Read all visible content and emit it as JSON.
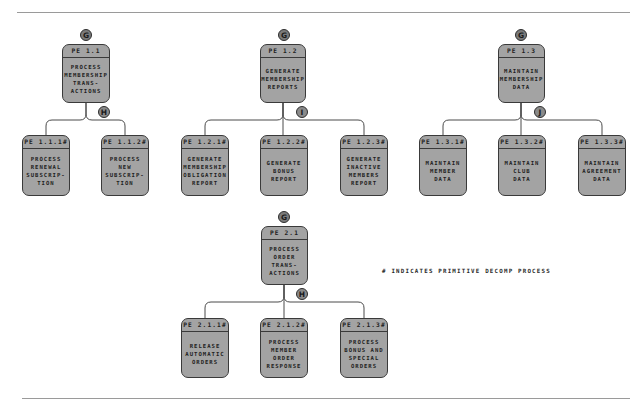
{
  "diagram": {
    "type": "process decomposition hierarchy",
    "colors": {
      "box_fill": "#a3a3a3",
      "box_border": "#3a3a3a",
      "badge_fill": "#8a8a8a",
      "line": "#555555"
    },
    "note": "# INDICATES PRIMITIVE DECOMP PROCESS",
    "groups": [
      {
        "parent": {
          "id": "PE 1.1",
          "lines": [
            "PROCESS",
            "MEMBERSHIP",
            "TRANS-",
            "ACTIONS"
          ],
          "top_badge": "G",
          "bottom_badge": "H"
        },
        "children": [
          {
            "id": "PE 1.1.1#",
            "lines": [
              "PROCESS",
              "RENEWAL",
              "SUBSCRIP-",
              "TION"
            ]
          },
          {
            "id": "PE 1.1.2#",
            "lines": [
              "PROCESS",
              "NEW",
              "SUBSCRIP-",
              "TION"
            ]
          }
        ]
      },
      {
        "parent": {
          "id": "PE 1.2",
          "lines": [
            "GENERATE",
            "MEMBERSHIP",
            "REPORTS"
          ],
          "top_badge": "G",
          "bottom_badge": "I"
        },
        "children": [
          {
            "id": "PE 1.2.1#",
            "lines": [
              "GENERATE",
              "MEMBERSHIP",
              "OBLIGATION",
              "REPORT"
            ]
          },
          {
            "id": "PE 1.2.2#",
            "lines": [
              "GENERATE",
              "BONUS",
              "REPORT"
            ]
          },
          {
            "id": "PE 1.2.3#",
            "lines": [
              "GENERATE",
              "INACTIVE",
              "MEMBERS",
              "REPORT"
            ]
          }
        ]
      },
      {
        "parent": {
          "id": "PE 1.3",
          "lines": [
            "MAINTAIN",
            "MEMBERSHIP",
            "DATA"
          ],
          "top_badge": "G",
          "bottom_badge": "J"
        },
        "children": [
          {
            "id": "PE 1.3.1#",
            "lines": [
              "MAINTAIN",
              "MEMBER",
              "DATA"
            ]
          },
          {
            "id": "PE 1.3.2#",
            "lines": [
              "MAINTAIN",
              "CLUB",
              "DATA"
            ]
          },
          {
            "id": "PE 1.3.3#",
            "lines": [
              "MAINTAIN",
              "AGREEMENT",
              "DATA"
            ]
          }
        ]
      },
      {
        "parent": {
          "id": "PE 2.1",
          "lines": [
            "PROCESS",
            "ORDER",
            "TRANS-",
            "ACTIONS"
          ],
          "top_badge": "G",
          "bottom_badge": "H"
        },
        "children": [
          {
            "id": "PE 2.1.1#",
            "lines": [
              "RELEASE",
              "AUTOMATIC",
              "ORDERS"
            ]
          },
          {
            "id": "PE 2.1.2#",
            "lines": [
              "PROCESS",
              "MEMBER",
              "ORDER",
              "RESPONSE"
            ]
          },
          {
            "id": "PE 2.1.3#",
            "lines": [
              "PROCESS",
              "BONUS AND",
              "SPECIAL",
              "ORDERS"
            ]
          }
        ]
      }
    ]
  }
}
